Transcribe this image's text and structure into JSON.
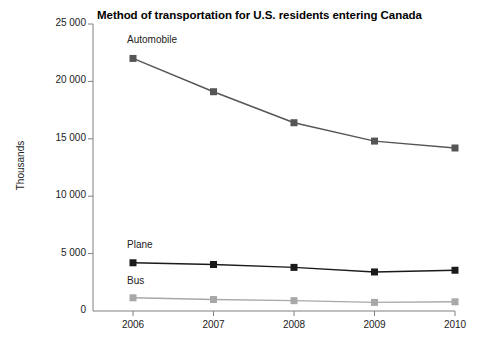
{
  "chart_data": {
    "type": "line",
    "title": "Method of transportation for U.S. residents entering Canada",
    "xlabel": "",
    "ylabel": "Thousands",
    "categories": [
      "2006",
      "2007",
      "2008",
      "2009",
      "2010"
    ],
    "x": [
      2006,
      2007,
      2008,
      2009,
      2010
    ],
    "ylim": [
      0,
      25000
    ],
    "xlim": [
      2006,
      2010
    ],
    "yticks": [
      0,
      5000,
      10000,
      15000,
      20000,
      25000
    ],
    "ytick_labels": [
      "0",
      "5 000",
      "10 000",
      "15 000",
      "20 000",
      "25 000"
    ],
    "xtick_labels": [
      "2006",
      "2007",
      "2008",
      "2009",
      "2010"
    ],
    "grid": false,
    "legend_position": "inline-labels",
    "series": [
      {
        "name": "Automobile",
        "color": "#555555",
        "marker": "square",
        "values": [
          22000,
          19100,
          16400,
          14800,
          14200
        ]
      },
      {
        "name": "Plane",
        "color": "#1a1a1a",
        "marker": "square",
        "values": [
          4200,
          4050,
          3800,
          3400,
          3550
        ]
      },
      {
        "name": "Bus",
        "color": "#a8a8a8",
        "marker": "square",
        "values": [
          1150,
          1000,
          900,
          750,
          800
        ]
      }
    ],
    "axis_color": "#808080",
    "background": "#ffffff"
  },
  "labels": {
    "y_axis_title": "Thousands",
    "series_automobile": "Automobile",
    "series_plane": "Plane",
    "series_bus": "Bus"
  }
}
